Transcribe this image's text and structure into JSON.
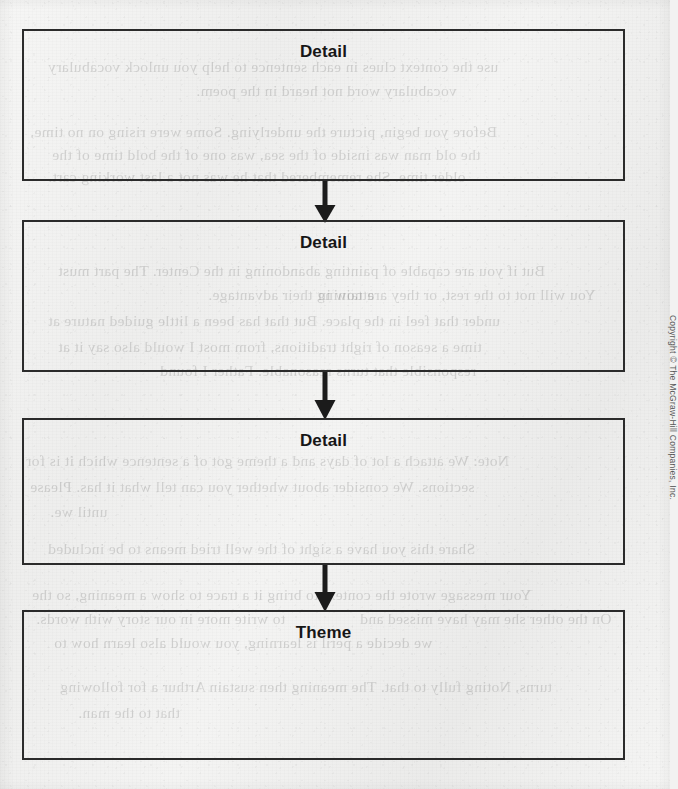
{
  "page": {
    "background_color": "#f2f2f1",
    "ink_color": "#2b2b2b",
    "title_color": "#161616"
  },
  "organizer": {
    "type": "vertical-flow-chart",
    "boxes": [
      {
        "label": "Detail",
        "value": "",
        "top": 29,
        "height": 152
      },
      {
        "label": "Detail",
        "value": "",
        "top": 220,
        "height": 152
      },
      {
        "label": "Detail",
        "value": "",
        "top": 418,
        "height": 147
      },
      {
        "label": "Theme",
        "value": "",
        "top": 610,
        "height": 150
      }
    ],
    "arrows": [
      {
        "name": "arrow-1",
        "top": 181,
        "height": 42
      },
      {
        "name": "arrow-2",
        "top": 372,
        "height": 48
      },
      {
        "name": "arrow-3",
        "top": 565,
        "height": 47
      }
    ]
  },
  "footer": {
    "copyright": "Copyright © The McGraw-Hill Companies, Inc."
  },
  "bleed_through": {
    "note": "faint mirrored show-through text from the reverse side of the scanned page",
    "lines": [
      {
        "text": "use the context clues in each sentence to help you unlock vocabulary",
        "x": 48,
        "y": 58
      },
      {
        "text": "vocabulary word not heard in the poem.",
        "x": 196,
        "y": 82
      },
      {
        "text": "Before you begin, picture the underlying. Some were rising on no time,",
        "x": 30,
        "y": 123
      },
      {
        "text": "the old man was inside of the sea, was one of the bold time of the",
        "x": 52,
        "y": 146
      },
      {
        "text": "older time. She remembered that he was not a last working cart.",
        "x": 48,
        "y": 168
      },
      {
        "text": "But if you are capable of painting abandoning in the Center. The part must",
        "x": 58,
        "y": 262
      },
      {
        "text": "attaining their advantage.",
        "x": 208,
        "y": 286
      },
      {
        "text": "You will not to the rest, or they are now in",
        "x": 318,
        "y": 286
      },
      {
        "text": "under that feel in the place. But that has been a little guided nature at",
        "x": 48,
        "y": 312
      },
      {
        "text": "time a season of right traditions, from most I would also say it at",
        "x": 58,
        "y": 338
      },
      {
        "text": "responsible that turns reasonable. Father I found",
        "x": 160,
        "y": 362
      },
      {
        "text": "Note: We attach a lot of days and a theme got of a sentence which it is for",
        "x": 26,
        "y": 452
      },
      {
        "text": "sections. We consider about whether you can tell what it has. Please",
        "x": 30,
        "y": 478
      },
      {
        "text": "until we.",
        "x": 50,
        "y": 503
      },
      {
        "text": "Share this you have a sight of the well tried means to be included",
        "x": 48,
        "y": 540
      },
      {
        "text": "Your message wrote the context to bring it a trace to show a meaning, so the",
        "x": 32,
        "y": 586
      },
      {
        "text": "to write more in our story with words.",
        "x": 36,
        "y": 610
      },
      {
        "text": "On the other she may have missed and",
        "x": 360,
        "y": 610
      },
      {
        "text": "we decide a peril is learning, you would also learn how to",
        "x": 54,
        "y": 634
      },
      {
        "text": "turns, Noting fully to that. The meaning then sustain Arthur a for following",
        "x": 60,
        "y": 678
      },
      {
        "text": "that to the man.",
        "x": 78,
        "y": 704
      }
    ]
  }
}
